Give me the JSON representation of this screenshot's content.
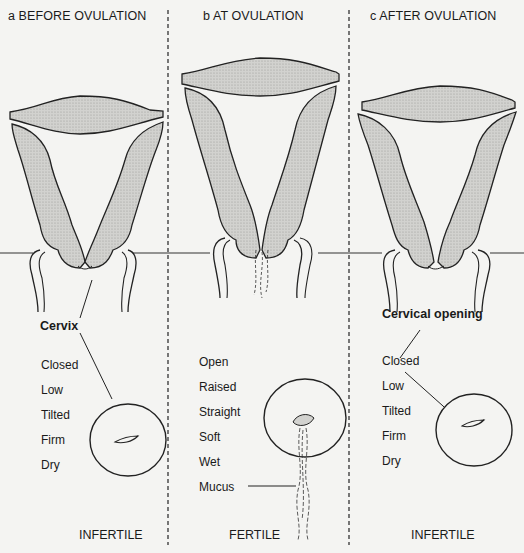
{
  "figure": {
    "panels": [
      {
        "id": "a",
        "title": "a  BEFORE OVULATION",
        "pointer_label": "Cervix",
        "conditions": [
          "Closed",
          "Low",
          "Tilted",
          "Firm",
          "Dry"
        ],
        "fertility": "INFERTILE"
      },
      {
        "id": "b",
        "title": "b  AT OVULATION",
        "conditions": [
          "Open",
          "Raised",
          "Straight",
          "Soft",
          "Wet"
        ],
        "mucus_label": "Mucus",
        "fertility": "FERTILE"
      },
      {
        "id": "c",
        "title": "c  AFTER OVULATION",
        "pointer_label": "Cervical opening",
        "conditions": [
          "Closed",
          "Low",
          "Tilted",
          "Firm",
          "Dry"
        ],
        "fertility": "INFERTILE"
      }
    ]
  },
  "colors": {
    "background": "#f4f4f2",
    "ink": "#1a1a1a",
    "tissue_fill": "#c9c9c6",
    "stipple": "#8a8a88"
  }
}
